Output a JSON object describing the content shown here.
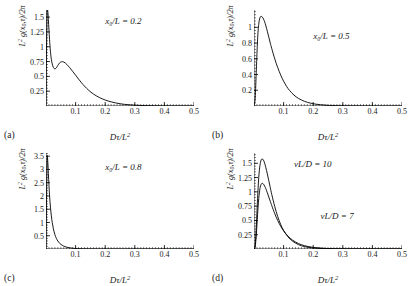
{
  "figure": {
    "axis": {
      "xlabel": "Dτ/L²",
      "ylabel": "L² g(x₀,τ)/2π",
      "xlim": [
        0,
        0.5
      ],
      "xticks": [
        0.1,
        0.2,
        0.3,
        0.4,
        0.5
      ],
      "xticklabels": [
        "0.1",
        "0.2",
        "0.3",
        "0.4",
        "0.5"
      ],
      "grid": false,
      "line_color": "#000000"
    },
    "panels": [
      {
        "letter": "(a)",
        "annotation": "x₀/L = 0.2",
        "annotation_x": 0.2,
        "annotation_y": 1.42,
        "ylim": [
          0,
          1.62
        ],
        "yticks": [
          0.25,
          0.5,
          0.75,
          1,
          1.25,
          1.5
        ],
        "yticklabels": [
          "0.25",
          "0.5",
          "0.75",
          "1",
          "1.25",
          "1.5"
        ]
      },
      {
        "letter": "(b)",
        "annotation": "x₀/L = 0.5",
        "annotation_x": 0.2,
        "annotation_y": 0.88,
        "ylim": [
          0,
          1.22
        ],
        "yticks": [
          0.2,
          0.4,
          0.6,
          0.8,
          1
        ],
        "yticklabels": [
          "0.2",
          "0.4",
          "0.6",
          "0.8",
          "1"
        ]
      },
      {
        "letter": "(c)",
        "annotation": "x₀/L = 0.8",
        "annotation_x": 0.2,
        "annotation_y": 3.05,
        "ylim": [
          0,
          3.62
        ],
        "yticks": [
          0.5,
          1,
          1.5,
          2,
          2.5,
          3,
          3.5
        ],
        "yticklabels": [
          "0.5",
          "1",
          "1.5",
          "2",
          "2.5",
          "3",
          "3.5"
        ]
      },
      {
        "letter": "(d)",
        "annotation": "",
        "ylim": [
          0,
          1.68
        ],
        "yticks": [
          0.25,
          0.5,
          0.75,
          1,
          1.25,
          1.5
        ],
        "yticklabels": [
          "0.25",
          "0.5",
          "0.75",
          "1",
          "1.25",
          "1.5"
        ],
        "curve_labels": [
          {
            "text": "vL/D = 10",
            "x": 0.135,
            "y": 1.47
          },
          {
            "text": "vL/D = 7",
            "x": 0.225,
            "y": 0.56
          }
        ]
      }
    ]
  },
  "chart_data": [
    {
      "type": "line",
      "title": "",
      "panel": "(a)",
      "xlabel": "Dτ/L²",
      "ylabel": "L² g(x₀,τ)/2π",
      "xlim": [
        0,
        0.5
      ],
      "ylim": [
        0,
        1.62
      ],
      "annotation": "x₀/L = 0.2",
      "series": [
        {
          "name": "x0/L=0.2",
          "x": [
            0.0,
            0.002,
            0.004,
            0.006,
            0.008,
            0.01,
            0.012,
            0.015,
            0.018,
            0.021,
            0.025,
            0.03,
            0.035,
            0.04,
            0.045,
            0.05,
            0.055,
            0.06,
            0.065,
            0.07,
            0.08,
            0.09,
            0.1,
            0.11,
            0.12,
            0.13,
            0.145,
            0.16,
            0.18,
            0.2,
            0.22,
            0.25,
            0.28,
            0.32,
            0.37,
            0.42,
            0.5
          ],
          "y": [
            0.0,
            1.05,
            1.62,
            1.6,
            1.46,
            1.28,
            1.12,
            0.92,
            0.79,
            0.71,
            0.65,
            0.625,
            0.645,
            0.685,
            0.722,
            0.742,
            0.748,
            0.742,
            0.726,
            0.703,
            0.648,
            0.585,
            0.52,
            0.455,
            0.392,
            0.335,
            0.262,
            0.203,
            0.144,
            0.101,
            0.07,
            0.038,
            0.021,
            0.009,
            0.003,
            0.001,
            0.0
          ]
        }
      ]
    },
    {
      "type": "line",
      "title": "",
      "panel": "(b)",
      "xlabel": "Dτ/L²",
      "ylabel": "L² g(x₀,τ)/2π",
      "xlim": [
        0,
        0.5
      ],
      "ylim": [
        0,
        1.22
      ],
      "annotation": "x₀/L = 0.5",
      "series": [
        {
          "name": "x0/L=0.5",
          "x": [
            0.0,
            0.004,
            0.008,
            0.012,
            0.016,
            0.02,
            0.024,
            0.028,
            0.032,
            0.036,
            0.04,
            0.045,
            0.05,
            0.055,
            0.06,
            0.07,
            0.08,
            0.09,
            0.1,
            0.11,
            0.12,
            0.135,
            0.15,
            0.17,
            0.19,
            0.21,
            0.24,
            0.27,
            0.31,
            0.36,
            0.42,
            0.5
          ],
          "y": [
            0.0,
            0.1,
            0.47,
            0.84,
            1.04,
            1.12,
            1.14,
            1.13,
            1.105,
            1.07,
            1.02,
            0.95,
            0.875,
            0.8,
            0.73,
            0.6,
            0.49,
            0.395,
            0.315,
            0.25,
            0.198,
            0.139,
            0.097,
            0.06,
            0.037,
            0.023,
            0.011,
            0.005,
            0.002,
            0.001,
            0.0,
            0.0
          ]
        }
      ]
    },
    {
      "type": "line",
      "title": "",
      "panel": "(c)",
      "xlabel": "Dτ/L²",
      "ylabel": "L² g(x₀,τ)/2π",
      "xlim": [
        0,
        0.5
      ],
      "ylim": [
        0,
        3.62
      ],
      "annotation": "x₀/L = 0.8",
      "series": [
        {
          "name": "x0/L=0.8",
          "x": [
            0.0,
            0.002,
            0.004,
            0.006,
            0.008,
            0.01,
            0.012,
            0.015,
            0.018,
            0.021,
            0.025,
            0.03,
            0.035,
            0.04,
            0.045,
            0.05,
            0.06,
            0.07,
            0.08,
            0.09,
            0.1,
            0.115,
            0.13,
            0.15,
            0.175,
            0.2,
            0.24,
            0.29,
            0.35,
            0.42,
            0.5
          ],
          "y": [
            0.0,
            2.1,
            3.45,
            3.3,
            2.85,
            2.4,
            2.02,
            1.58,
            1.25,
            1.0,
            0.76,
            0.545,
            0.4,
            0.3,
            0.228,
            0.176,
            0.108,
            0.068,
            0.044,
            0.029,
            0.019,
            0.011,
            0.006,
            0.003,
            0.001,
            0.001,
            0.0,
            0.0,
            0.0,
            0.0,
            0.0
          ]
        }
      ]
    },
    {
      "type": "line",
      "title": "",
      "panel": "(d)",
      "xlabel": "Dτ/L²",
      "ylabel": "L² g(x₀,τ)/2π",
      "xlim": [
        0,
        0.5
      ],
      "ylim": [
        0,
        1.68
      ],
      "series": [
        {
          "name": "vL/D = 10",
          "x": [
            0.0,
            0.004,
            0.008,
            0.012,
            0.016,
            0.02,
            0.024,
            0.028,
            0.032,
            0.036,
            0.04,
            0.045,
            0.05,
            0.055,
            0.06,
            0.07,
            0.08,
            0.09,
            0.1,
            0.115,
            0.13,
            0.15,
            0.17,
            0.195,
            0.22,
            0.25,
            0.29,
            0.34,
            0.4,
            0.5
          ],
          "y": [
            0.0,
            0.07,
            0.42,
            0.88,
            1.25,
            1.46,
            1.555,
            1.575,
            1.555,
            1.5,
            1.425,
            1.315,
            1.195,
            1.075,
            0.955,
            0.745,
            0.57,
            0.432,
            0.325,
            0.212,
            0.138,
            0.077,
            0.043,
            0.021,
            0.011,
            0.004,
            0.001,
            0.0,
            0.0,
            0.0
          ]
        },
        {
          "name": "vL/D = 7",
          "x": [
            0.0,
            0.004,
            0.008,
            0.012,
            0.016,
            0.02,
            0.024,
            0.028,
            0.032,
            0.036,
            0.04,
            0.045,
            0.05,
            0.055,
            0.06,
            0.07,
            0.08,
            0.09,
            0.1,
            0.115,
            0.13,
            0.15,
            0.17,
            0.195,
            0.22,
            0.25,
            0.29,
            0.34,
            0.4,
            0.5
          ],
          "y": [
            0.0,
            0.04,
            0.26,
            0.6,
            0.88,
            1.055,
            1.13,
            1.15,
            1.135,
            1.1,
            1.055,
            0.985,
            0.91,
            0.835,
            0.76,
            0.62,
            0.5,
            0.4,
            0.318,
            0.224,
            0.156,
            0.096,
            0.059,
            0.032,
            0.018,
            0.008,
            0.002,
            0.001,
            0.0,
            0.0
          ]
        }
      ]
    }
  ]
}
